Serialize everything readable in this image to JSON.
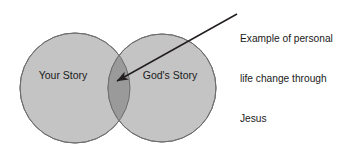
{
  "diagram": {
    "type": "venn",
    "title": "",
    "circles": [
      {
        "label": "Your Story",
        "cx": 75,
        "cy": 88,
        "r": 55,
        "fill": "#c4c4c4",
        "stroke": "#6e6e6e"
      },
      {
        "label": "God's Story",
        "cx": 162,
        "cy": 88,
        "r": 54,
        "fill": "#c4c4c4",
        "stroke": "#6e6e6e"
      }
    ],
    "intersection": {
      "fill": "#9a9a9a",
      "description": ""
    },
    "callout": {
      "lines": [
        "Example of personal",
        "life change through",
        "Jesus"
      ],
      "full_text": "Example of personal life change through Jesus",
      "arrow": {
        "from_x": 237,
        "from_y": 14,
        "to_x": 117,
        "to_y": 81,
        "color": "#231f20"
      }
    },
    "colors": {
      "background": "#ffffff",
      "circle_fill": "#c4c4c4",
      "overlap_fill": "#9a9a9a",
      "outline": "#6e6e6e",
      "text": "#1a1a1a"
    }
  }
}
